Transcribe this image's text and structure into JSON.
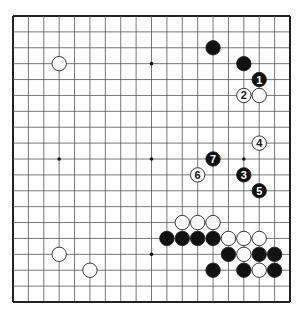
{
  "diagram": {
    "type": "go-board",
    "size": 19,
    "colors": {
      "background": "#ffffff",
      "line": "#555555",
      "border": "#222222",
      "black_stone": "#111111",
      "white_stone": "#ffffff"
    },
    "hoshi": [
      [
        3,
        3
      ],
      [
        9,
        3
      ],
      [
        15,
        3
      ],
      [
        3,
        9
      ],
      [
        9,
        9
      ],
      [
        15,
        9
      ],
      [
        3,
        15
      ],
      [
        9,
        15
      ],
      [
        15,
        15
      ]
    ],
    "stones": [
      {
        "color": "white",
        "col": 3,
        "row": 3,
        "label": ""
      },
      {
        "color": "black",
        "col": 13,
        "row": 2,
        "label": ""
      },
      {
        "color": "black",
        "col": 15,
        "row": 3,
        "label": ""
      },
      {
        "color": "black",
        "col": 16,
        "row": 4,
        "label": "1"
      },
      {
        "color": "white",
        "col": 15,
        "row": 5,
        "label": "2"
      },
      {
        "color": "white",
        "col": 16,
        "row": 5,
        "label": ""
      },
      {
        "color": "white",
        "col": 16,
        "row": 8,
        "label": "4"
      },
      {
        "color": "black",
        "col": 13,
        "row": 9,
        "label": "7"
      },
      {
        "color": "white",
        "col": 12,
        "row": 10,
        "label": "6"
      },
      {
        "color": "black",
        "col": 15,
        "row": 10,
        "label": "3"
      },
      {
        "color": "black",
        "col": 16,
        "row": 11,
        "label": "5"
      },
      {
        "color": "white",
        "col": 11,
        "row": 13,
        "label": ""
      },
      {
        "color": "white",
        "col": 12,
        "row": 13,
        "label": ""
      },
      {
        "color": "white",
        "col": 13,
        "row": 13,
        "label": ""
      },
      {
        "color": "black",
        "col": 10,
        "row": 14,
        "label": ""
      },
      {
        "color": "black",
        "col": 11,
        "row": 14,
        "label": ""
      },
      {
        "color": "black",
        "col": 12,
        "row": 14,
        "label": ""
      },
      {
        "color": "black",
        "col": 13,
        "row": 14,
        "label": ""
      },
      {
        "color": "white",
        "col": 14,
        "row": 14,
        "label": ""
      },
      {
        "color": "white",
        "col": 15,
        "row": 14,
        "label": ""
      },
      {
        "color": "white",
        "col": 16,
        "row": 14,
        "label": ""
      },
      {
        "color": "white",
        "col": 3,
        "row": 15,
        "label": ""
      },
      {
        "color": "black",
        "col": 14,
        "row": 15,
        "label": ""
      },
      {
        "color": "white",
        "col": 15,
        "row": 15,
        "label": ""
      },
      {
        "color": "black",
        "col": 16,
        "row": 15,
        "label": ""
      },
      {
        "color": "black",
        "col": 17,
        "row": 15,
        "label": ""
      },
      {
        "color": "white",
        "col": 5,
        "row": 16,
        "label": ""
      },
      {
        "color": "black",
        "col": 13,
        "row": 16,
        "label": ""
      },
      {
        "color": "black",
        "col": 15,
        "row": 16,
        "label": ""
      },
      {
        "color": "white",
        "col": 16,
        "row": 16,
        "label": ""
      },
      {
        "color": "black",
        "col": 17,
        "row": 16,
        "label": ""
      }
    ]
  }
}
